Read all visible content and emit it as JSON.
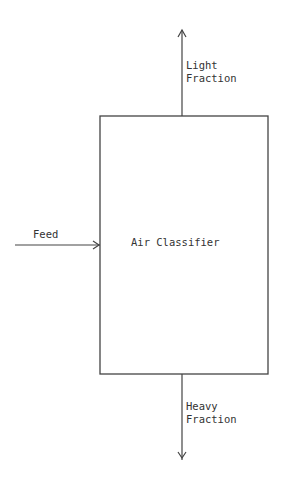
{
  "diagram": {
    "process_box": {
      "label": "Air Classifier"
    },
    "input": {
      "label": "Feed"
    },
    "outputs": [
      {
        "line1": "Light",
        "line2": "Fraction",
        "direction": "up"
      },
      {
        "line1": "Heavy",
        "line2": "Fraction",
        "direction": "down"
      }
    ],
    "colors": {
      "stroke": "#444444",
      "background": "#ffffff"
    }
  }
}
